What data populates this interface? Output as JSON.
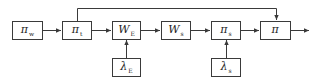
{
  "diagram": {
    "type": "block-diagram",
    "colors": {
      "stroke": "#3a3a3a",
      "background": "#ffffff",
      "text": "#222222"
    },
    "blocks": [
      {
        "id": "pi_w",
        "symbol": "π",
        "subscript": "w",
        "row": "main"
      },
      {
        "id": "pi_t",
        "symbol": "π",
        "subscript": "t",
        "row": "main"
      },
      {
        "id": "W_E",
        "symbol": "W",
        "subscript": "E",
        "row": "main"
      },
      {
        "id": "W_s",
        "symbol": "W",
        "subscript": "s",
        "row": "main"
      },
      {
        "id": "pi_s",
        "symbol": "π",
        "subscript": "s",
        "row": "main"
      },
      {
        "id": "pi",
        "symbol": "π",
        "subscript": "",
        "row": "main"
      },
      {
        "id": "lambda_E",
        "symbol": "λ",
        "subscript": "E",
        "row": "input"
      },
      {
        "id": "lambda_s",
        "symbol": "λ",
        "subscript": "s",
        "row": "input"
      }
    ],
    "edges": [
      {
        "from": "pi_w",
        "to": "pi_t"
      },
      {
        "from": "pi_t",
        "to": "W_E"
      },
      {
        "from": "W_E",
        "to": "W_s"
      },
      {
        "from": "W_s",
        "to": "pi_s"
      },
      {
        "from": "pi_s",
        "to": "pi"
      },
      {
        "from": "lambda_E",
        "to": "W_E"
      },
      {
        "from": "lambda_s",
        "to": "pi_s"
      },
      {
        "from": "pi_t",
        "to": "pi",
        "route": "over-top"
      },
      {
        "from": "pi",
        "to": "output"
      }
    ]
  }
}
